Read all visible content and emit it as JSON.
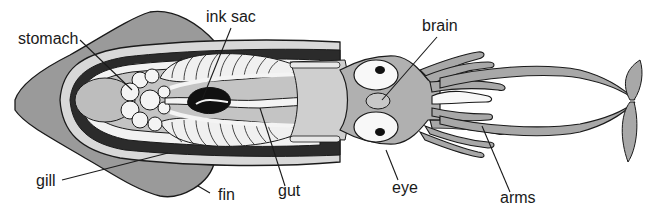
{
  "diagram": {
    "labels": [
      {
        "id": "stomach",
        "text": "stomach"
      },
      {
        "id": "ink_sac",
        "text": "ink sac"
      },
      {
        "id": "brain",
        "text": "brain"
      },
      {
        "id": "gill",
        "text": "gill"
      },
      {
        "id": "fin",
        "text": "fin"
      },
      {
        "id": "gut",
        "text": "gut"
      },
      {
        "id": "eye",
        "text": "eye"
      },
      {
        "id": "arms",
        "text": "arms"
      }
    ],
    "colors": {
      "fin": "#9a9a9a",
      "mantle": "#c8c8c8",
      "dark_band": "#2b2b2b",
      "organ_light": "#f2f2f2",
      "body_mid": "#b4b4b4",
      "head": "#a8a8a8",
      "outline": "#1a1a1a"
    }
  }
}
